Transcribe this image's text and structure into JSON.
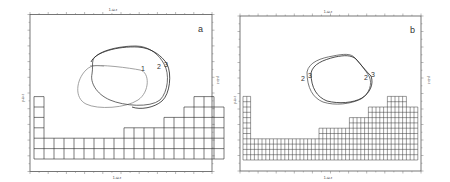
{
  "panels": [
    {
      "id": "a",
      "panel_label": "a",
      "axis_label_top": "1-ω-τ",
      "axis_label_bottom": "1-ω-τ",
      "axis_label_left": "y-ω-τ",
      "axis_label_right": "y-ω-τ",
      "curve_labels": [
        "1",
        "2",
        "3"
      ],
      "grid": {
        "columns": [
          6,
          2,
          2,
          2,
          2,
          2,
          2,
          2,
          2,
          3,
          3,
          3,
          3,
          4,
          4,
          5,
          6,
          6,
          5
        ],
        "cell_w": 10,
        "cell_h": 10.4
      }
    },
    {
      "id": "b",
      "panel_label": "b",
      "axis_label_top": "1-ω-τ",
      "axis_label_bottom": "1-ω-τ",
      "axis_label_left": "y-ω-τ",
      "axis_label_right": "y-ω-τ",
      "curve_labels": [
        "2",
        "3",
        "2",
        "3"
      ],
      "grid": {
        "columns": [
          12,
          12,
          4,
          4,
          4,
          4,
          4,
          4,
          4,
          4,
          4,
          4,
          4,
          4,
          4,
          4,
          4,
          4,
          4,
          4,
          6,
          6,
          6,
          6,
          6,
          6,
          6,
          6,
          8,
          8,
          8,
          8,
          8,
          10,
          10,
          10,
          10,
          10,
          12,
          12,
          12,
          12,
          12,
          10,
          10,
          10
        ],
        "cell_w": 3.8,
        "cell_h": 5.3
      }
    }
  ]
}
